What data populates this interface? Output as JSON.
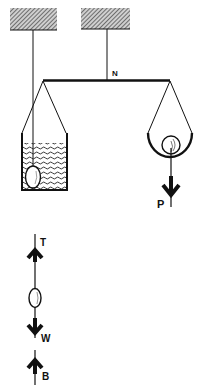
{
  "diagram": {
    "type": "physics-balance-buoyancy",
    "labels": {
      "pivot": "N",
      "weight": "P",
      "tension": "T",
      "gravity": "W",
      "buoyancy": "B"
    },
    "colors": {
      "ink": "#111111",
      "background": "#ffffff",
      "hatch": "#555555"
    }
  }
}
